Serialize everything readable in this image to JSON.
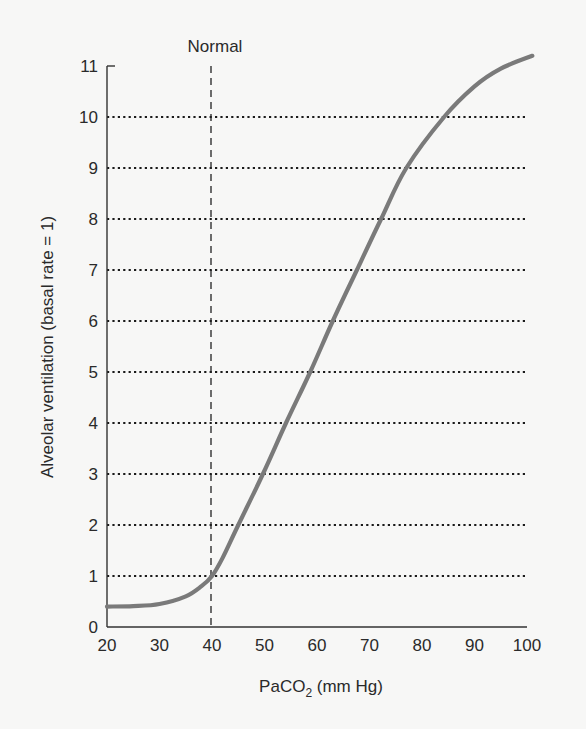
{
  "chart_data": {
    "type": "line",
    "title": "",
    "xlabel": "PaCO2 (mm Hg)",
    "xlabel_parts": {
      "main": "PaCO",
      "sub": "2",
      "rest": " (mm Hg)"
    },
    "ylabel": "Alveolar ventilation (basal rate = 1)",
    "xlim": [
      20,
      100
    ],
    "ylim": [
      0,
      11
    ],
    "x_ticks": [
      20,
      30,
      40,
      50,
      60,
      70,
      80,
      90,
      100
    ],
    "y_ticks": [
      0,
      1,
      2,
      3,
      4,
      5,
      6,
      7,
      8,
      9,
      10,
      11
    ],
    "grid": {
      "horizontal_dotted": [
        1,
        2,
        3,
        4,
        5,
        6,
        7,
        8,
        9,
        10
      ],
      "vertical": false
    },
    "legend": null,
    "annotations": [
      {
        "type": "vertical_dashed_line",
        "x": 40,
        "label": "Normal"
      }
    ],
    "series": [
      {
        "name": "Alveolar ventilation",
        "color": "#7a7a7a",
        "x": [
          20,
          25,
          30,
          35,
          38,
          40,
          42,
          45,
          49.7,
          54.1,
          58.7,
          63,
          67.6,
          72.2,
          77,
          84.2,
          90,
          95,
          101
        ],
        "y": [
          0.4,
          0.41,
          0.45,
          0.6,
          0.8,
          1.0,
          1.35,
          2.0,
          3.0,
          4.0,
          5.0,
          6.0,
          7.0,
          8.0,
          9.0,
          10.0,
          10.6,
          10.95,
          11.2
        ]
      }
    ]
  },
  "colors": {
    "background": "#f7f7f6",
    "axis": "#333333",
    "grid": "#1a1a1a",
    "curve": "#7a7a7a",
    "text": "#2a2a2a"
  }
}
